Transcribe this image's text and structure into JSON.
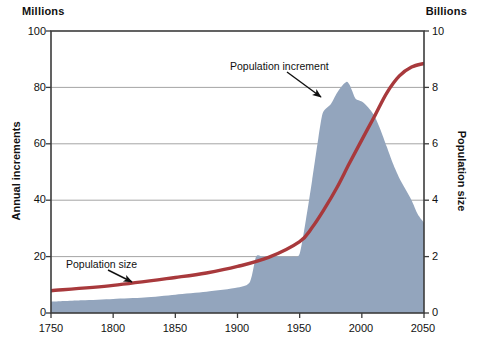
{
  "chart_data": {
    "type": "area",
    "title": "",
    "xlabel": "",
    "axes": {
      "x": {
        "min": 1750,
        "max": 2050,
        "ticks": [
          1750,
          1800,
          1850,
          1900,
          1950,
          2000,
          2050
        ],
        "tick_labels": [
          "1750",
          "1800",
          "1850",
          "1900",
          "1950",
          "2000",
          "2050"
        ]
      },
      "y_left": {
        "unit": "Millions",
        "label": "Annual increments",
        "min": 0,
        "max": 100,
        "ticks": [
          0,
          20,
          40,
          60,
          80,
          100
        ],
        "tick_labels": [
          "0",
          "20",
          "40",
          "60",
          "80",
          "100"
        ],
        "grid": true
      },
      "y_right": {
        "unit": "Billions",
        "label": "Population size",
        "min": 0,
        "max": 10,
        "ticks": [
          0,
          2,
          4,
          6,
          8,
          10
        ],
        "tick_labels": [
          "0",
          "2",
          "4",
          "6",
          "8",
          "10"
        ],
        "grid": false
      }
    },
    "legend_position": "inline-annotations",
    "annotations": [
      {
        "name": "population-increment",
        "text": "Population increment",
        "points_to_x": 1972,
        "points_to_y_left": 79
      },
      {
        "name": "population-size",
        "text": "Population size",
        "points_to_x": 1840,
        "points_to_y_right": 1.15
      }
    ],
    "series": [
      {
        "name": "Population increment",
        "type": "area",
        "axis": "y_left",
        "unit": "Millions per year",
        "color": "#93a5bd",
        "x": [
          1750,
          1775,
          1800,
          1825,
          1850,
          1875,
          1900,
          1910,
          1915,
          1920,
          1925,
          1930,
          1935,
          1940,
          1945,
          1950,
          1955,
          1960,
          1965,
          1968,
          1970,
          1975,
          1980,
          1985,
          1988,
          1990,
          1992,
          1995,
          2000,
          2005,
          2010,
          2015,
          2020,
          2025,
          2030,
          2035,
          2040,
          2045,
          2050
        ],
        "values": [
          4,
          4.5,
          5,
          5.5,
          6.5,
          7.5,
          9,
          11,
          20,
          20,
          20,
          20,
          20,
          20,
          20,
          21,
          33,
          47,
          62,
          70,
          72,
          74,
          78,
          81,
          82,
          81,
          79,
          76,
          75,
          73,
          70,
          65,
          59,
          53,
          48,
          44,
          40,
          35,
          32
        ]
      },
      {
        "name": "Population size",
        "type": "line",
        "axis": "y_right",
        "unit": "Billions",
        "color": "#a8393c",
        "x": [
          1750,
          1800,
          1850,
          1875,
          1900,
          1925,
          1950,
          1960,
          1970,
          1980,
          1990,
          2000,
          2010,
          2020,
          2030,
          2040,
          2050
        ],
        "values": [
          0.79,
          0.98,
          1.26,
          1.42,
          1.65,
          1.97,
          2.53,
          3.03,
          3.7,
          4.45,
          5.31,
          6.14,
          6.96,
          7.8,
          8.4,
          8.72,
          8.85
        ]
      }
    ]
  },
  "labels": {
    "unit_left": "Millions",
    "unit_right": "Billions",
    "axis_title_left": "Annual increments",
    "axis_title_right": "Population size",
    "annot_increment": "Population increment",
    "annot_size": "Population size",
    "y_left": [
      "100",
      "80",
      "60",
      "40",
      "20",
      "0"
    ],
    "y_right": [
      "10",
      "8",
      "6",
      "4",
      "2",
      "0"
    ],
    "x": [
      "1750",
      "1800",
      "1850",
      "1900",
      "1950",
      "2000",
      "2050"
    ]
  },
  "colors": {
    "area": "#93a5bd",
    "line": "#a8393c",
    "axis": "#3c3c3c",
    "grid": "#9a9a9a"
  }
}
